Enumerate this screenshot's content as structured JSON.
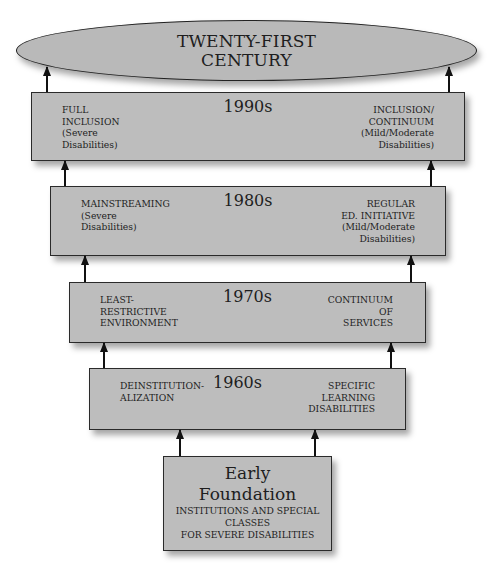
{
  "top": {
    "line1": "TWENTY-FIRST",
    "line2": "CENTURY"
  },
  "eras": [
    {
      "label": "1990s",
      "left": [
        "FULL",
        "INCLUSION",
        "(Severe",
        "Disabilities)"
      ],
      "right": [
        "INCLUSION/",
        "CONTINUUM",
        "(Mild/Moderate",
        "Disabilities)"
      ]
    },
    {
      "label": "1980s",
      "left": [
        "MAINSTREAMING",
        "(Severe",
        "Disabilities)"
      ],
      "right": [
        "REGULAR",
        "ED. INITIATIVE",
        "(Mild/Moderate",
        "Disabilities)"
      ]
    },
    {
      "label": "1970s",
      "left": [
        "LEAST-",
        "RESTRICTIVE",
        "ENVIRONMENT"
      ],
      "right": [
        "CONTINUUM",
        "OF",
        "SERVICES"
      ]
    },
    {
      "label": "1960s",
      "left": [
        "DEINSTITUTION-",
        "ALIZATION"
      ],
      "right": [
        "SPECIFIC",
        "LEARNING",
        "DISABILITIES"
      ]
    }
  ],
  "foundation": {
    "title1": "Early",
    "title2": "Foundation",
    "line1": "INSTITUTIONS AND SPECIAL",
    "line2": "CLASSES",
    "line3": "FOR SEVERE DISABILITIES"
  },
  "colors": {
    "box_fill": "#bdbdbd",
    "ellipse_fill": "#b9b9b9",
    "border": "#2a2a2a"
  }
}
